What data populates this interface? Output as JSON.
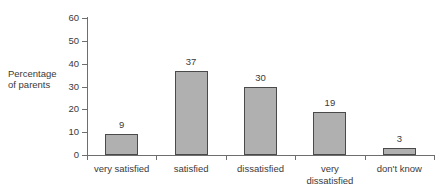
{
  "chart_data": {
    "type": "bar",
    "title": "",
    "xlabel": "",
    "ylabel": "Percentage of parents",
    "ylabel_lines": [
      "Percentage",
      "of parents"
    ],
    "categories": [
      "very satisfied",
      "satisfied",
      "dissatisfied",
      "very dissatisfied",
      "don't know"
    ],
    "category_lines": [
      [
        "very satisfied"
      ],
      [
        "satisfied"
      ],
      [
        "dissatisfied"
      ],
      [
        "very",
        "dissatisfied"
      ],
      [
        "don't know"
      ]
    ],
    "values": [
      9,
      37,
      30,
      19,
      3
    ],
    "value_labels": [
      "9",
      "37",
      "30",
      "19",
      "3"
    ],
    "ylim": [
      0,
      60
    ],
    "yticks": [
      0,
      10,
      20,
      30,
      40,
      50,
      60
    ],
    "ytick_labels": [
      "0",
      "10",
      "20",
      "30",
      "40",
      "50",
      "60"
    ],
    "grid": false,
    "legend": false,
    "bar_fill": "#b0b0b0",
    "bar_border": "#4a4a4a",
    "axis_color": "#6e6e6e",
    "text_color": "#3a3a3a"
  },
  "top_clipped_text": ""
}
